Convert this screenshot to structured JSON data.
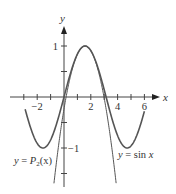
{
  "chart_data": {
    "type": "line",
    "title": "",
    "xlabel": "x",
    "ylabel": "y",
    "xlim": [
      -3.2,
      7
    ],
    "ylim": [
      -1.75,
      1.35
    ],
    "x_ticks": [
      -3,
      -2,
      -1,
      0,
      1,
      2,
      3,
      4,
      5,
      6
    ],
    "x_tick_labels": [
      {
        "value": -2,
        "label": "−2"
      },
      {
        "value": 2,
        "label": "2"
      },
      {
        "value": 4,
        "label": "4"
      },
      {
        "value": 6,
        "label": "6"
      }
    ],
    "y_ticks": [
      -1.5,
      -1,
      -0.5,
      0.5,
      1
    ],
    "y_tick_labels": [
      {
        "value": 1,
        "label": "1"
      },
      {
        "value": -1,
        "label": "−1"
      }
    ],
    "grid": false,
    "legend": "none",
    "series": [
      {
        "name": "sin x",
        "label": "y = sin x",
        "expression": "sin(x)",
        "domain": [
          -2.9,
          6.0
        ],
        "color": "#555555"
      },
      {
        "name": "P2(x)",
        "label": "y = P2(x)",
        "expression": "1 - (x - pi/2)^2 / 2",
        "domain": [
          -0.75,
          3.89
        ],
        "color": "#555555"
      }
    ],
    "annotations": [
      {
        "text": "y = P2(x)",
        "position": "lower-left"
      },
      {
        "text": "y = sin x",
        "position": "lower-right"
      }
    ]
  },
  "labels": {
    "x_axis": "x",
    "y_axis": "y",
    "sin_label_prefix": "y = ",
    "sin_label_fn": "sin",
    "sin_label_var": "x",
    "p2_label_prefix": "y = ",
    "p2_label_P": "P",
    "p2_label_sub": "2",
    "p2_label_arg": "(x)"
  }
}
